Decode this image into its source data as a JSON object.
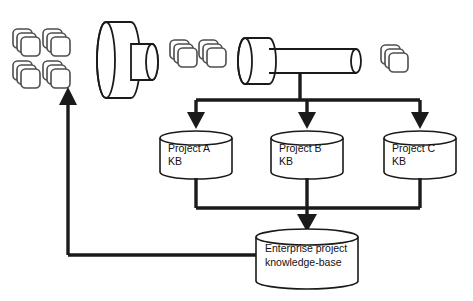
{
  "diagram": {
    "colors": {
      "stroke_dark": "#1a1a1a",
      "stroke_grey": "#4d4d4d",
      "fill_white": "#ffffff",
      "background": "#ffffff",
      "text": "#111111"
    },
    "project_kbs": [
      {
        "id": "project-a",
        "line1": "Project A",
        "line2": "KB"
      },
      {
        "id": "project-b",
        "line1": "Project B",
        "line2": "KB"
      },
      {
        "id": "project-c",
        "line1": "Project C",
        "line2": "KB"
      }
    ],
    "enterprise_kb": {
      "id": "enterprise-kb",
      "line1": "Enterprise project",
      "line2": "knowledge-base"
    },
    "document_stacks": [
      {
        "id": "docs-left-top-left",
        "count": 3
      },
      {
        "id": "docs-left-top-right",
        "count": 3
      },
      {
        "id": "docs-left-bottom-left",
        "count": 3
      },
      {
        "id": "docs-left-bottom-right",
        "count": 3
      },
      {
        "id": "docs-mid-left",
        "count": 3
      },
      {
        "id": "docs-mid-right",
        "count": 3
      },
      {
        "id": "docs-right",
        "count": 3
      }
    ],
    "funnels": [
      {
        "id": "funnel-large",
        "shape": "cylinder-with-nozzle"
      },
      {
        "id": "funnel-small",
        "shape": "cylinder-with-long-tube"
      }
    ],
    "connectors": [
      {
        "id": "feed-bus-down",
        "type": "arrow-down"
      },
      {
        "id": "merge-bus-down",
        "type": "arrow-down"
      },
      {
        "id": "feedback-loop",
        "type": "arrow-up"
      }
    ]
  }
}
